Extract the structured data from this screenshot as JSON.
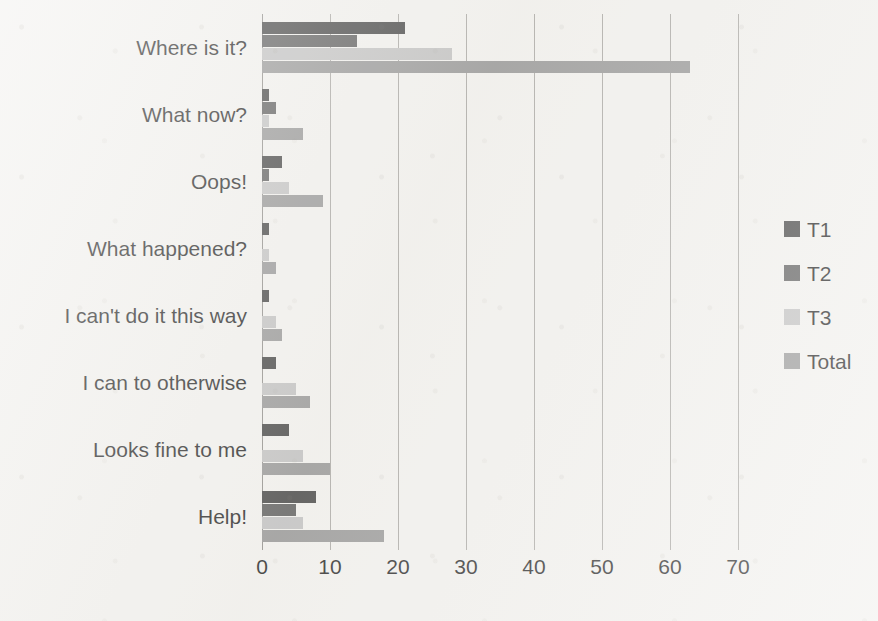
{
  "chart_data": {
    "type": "bar",
    "orientation": "horizontal",
    "title": "",
    "xlabel": "",
    "ylabel": "",
    "xlim": [
      0,
      70
    ],
    "xticks": [
      0,
      10,
      20,
      30,
      40,
      50,
      60,
      70
    ],
    "grid": true,
    "legend_position": "right",
    "categories": [
      "Where is it?",
      "What now?",
      "Oops!",
      "What happened?",
      "I can't do it this way",
      "I can to otherwise",
      "Looks fine to me",
      "Help!"
    ],
    "series": [
      {
        "name": "T1",
        "color": "#404040",
        "values": [
          21,
          1,
          3,
          1,
          1,
          2,
          4,
          8
        ]
      },
      {
        "name": "T2",
        "color": "#595959",
        "values": [
          14,
          2,
          1,
          0,
          0,
          0,
          0,
          5
        ]
      },
      {
        "name": "T3",
        "color": "#c0c0c0",
        "values": [
          28,
          1,
          4,
          1,
          2,
          5,
          6,
          6
        ]
      },
      {
        "name": "Total",
        "color": "#949494",
        "values": [
          63,
          6,
          9,
          2,
          3,
          7,
          10,
          18
        ]
      }
    ]
  },
  "legend": {
    "items": [
      {
        "label": "T1",
        "color": "#404040"
      },
      {
        "label": "T2",
        "color": "#595959"
      },
      {
        "label": "T3",
        "color": "#c0c0c0"
      },
      {
        "label": "Total",
        "color": "#949494"
      }
    ]
  },
  "axis": {
    "tick_labels": [
      "0",
      "10",
      "20",
      "30",
      "40",
      "50",
      "60",
      "70"
    ]
  }
}
